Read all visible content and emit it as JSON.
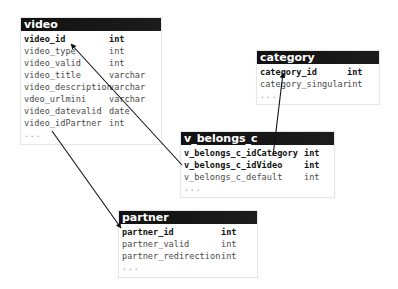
{
  "diagram": {
    "type": "database-schema",
    "tables": [
      {
        "name": "video",
        "columns": [
          {
            "name": "video_id",
            "type": "int",
            "key": "pk"
          },
          {
            "name": "video_type",
            "type": "int",
            "key": ""
          },
          {
            "name": "video_valid",
            "type": "int",
            "key": ""
          },
          {
            "name": "video_title",
            "type": "varchar",
            "key": ""
          },
          {
            "name": "video_description",
            "type": "varchar",
            "key": ""
          },
          {
            "name": "vdeo_urlmini",
            "type": "varchar",
            "key": ""
          },
          {
            "name": "video_datevalid",
            "type": "date",
            "key": ""
          },
          {
            "name": "video_idPartner",
            "type": "int",
            "key": ""
          }
        ],
        "more": "..."
      },
      {
        "name": "category",
        "columns": [
          {
            "name": "category_id",
            "type": "int",
            "key": "pk"
          },
          {
            "name": "category_singular",
            "type": "int",
            "key": ""
          }
        ],
        "more": "..."
      },
      {
        "name": "v_belongs_c",
        "columns": [
          {
            "name": "v_belongs_c_idCategory",
            "type": "int",
            "key": "fk"
          },
          {
            "name": "v_belongs_c_idVideo",
            "type": "int",
            "key": "fk"
          },
          {
            "name": "v_belongs_c_default",
            "type": "int",
            "key": ""
          }
        ],
        "more": "..."
      },
      {
        "name": "partner",
        "columns": [
          {
            "name": "partner_id",
            "type": "int",
            "key": "pk"
          },
          {
            "name": "partner_valid",
            "type": "int",
            "key": ""
          },
          {
            "name": "partner_redirection",
            "type": "int",
            "key": ""
          }
        ],
        "more": "..."
      }
    ],
    "relations": [
      {
        "from": "v_belongs_c.v_belongs_c_idVideo",
        "to": "video.video_id"
      },
      {
        "from": "v_belongs_c.v_belongs_c_idCategory",
        "to": "category.category_id"
      },
      {
        "from": "video.video_idPartner",
        "to": "partner.partner_id"
      }
    ],
    "colors": {
      "header_bg": "#141414",
      "header_text": "#ffffff",
      "line": "#111111",
      "body_text": "#4a4a4a"
    }
  }
}
